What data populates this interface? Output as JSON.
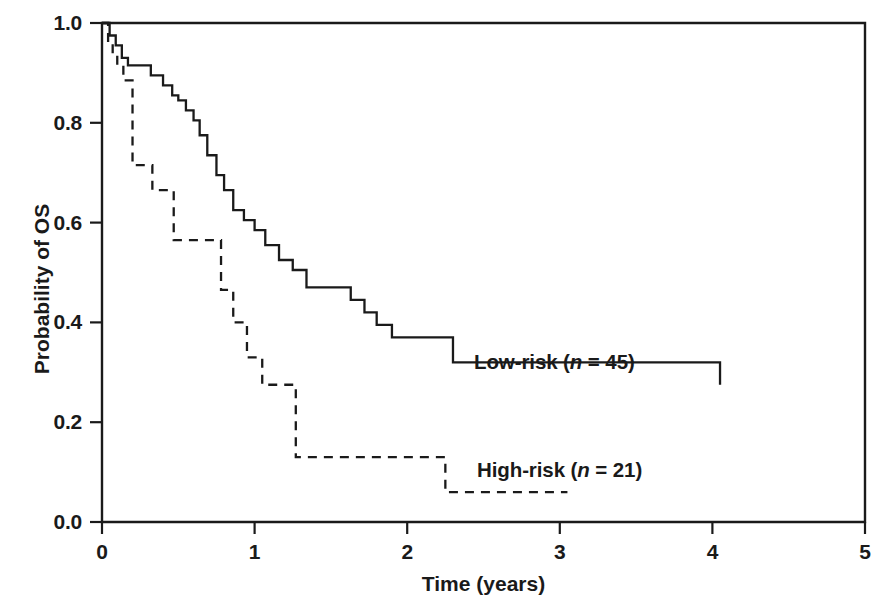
{
  "chart_data": {
    "type": "line",
    "subtype": "kaplan-meier-step",
    "title": "",
    "xlabel": "Time (years)",
    "ylabel": "Probability of OS",
    "xlim": [
      0,
      5
    ],
    "ylim": [
      0.0,
      1.0
    ],
    "xticks": [
      0,
      1,
      2,
      3,
      4,
      5
    ],
    "xtick_labels": [
      "0",
      "1",
      "2",
      "3",
      "4",
      "5"
    ],
    "yticks": [
      0.0,
      0.2,
      0.4,
      0.6,
      0.8,
      1.0
    ],
    "ytick_labels": [
      "0.0",
      "0.2",
      "0.4",
      "0.6",
      "0.8",
      "1.0"
    ],
    "grid": false,
    "legend_position": "inline-annotation",
    "series": [
      {
        "name": "Low-risk",
        "label_text": "Low-risk (n = 45)",
        "label_prefix": "Low-risk (",
        "label_italic": "n",
        "label_suffix": " = 45)",
        "n": 45,
        "linestyle": "solid",
        "color": "#1a1a1a",
        "x": [
          0.0,
          0.05,
          0.09,
          0.13,
          0.17,
          0.24,
          0.32,
          0.4,
          0.46,
          0.5,
          0.55,
          0.6,
          0.64,
          0.69,
          0.75,
          0.8,
          0.86,
          0.93,
          1.0,
          1.07,
          1.16,
          1.25,
          1.34,
          1.55,
          1.63,
          1.72,
          1.8,
          1.9,
          2.3,
          4.05
        ],
        "y": [
          1.0,
          0.975,
          0.955,
          0.93,
          0.915,
          0.915,
          0.895,
          0.875,
          0.855,
          0.845,
          0.825,
          0.805,
          0.775,
          0.735,
          0.695,
          0.665,
          0.625,
          0.605,
          0.585,
          0.555,
          0.525,
          0.505,
          0.47,
          0.47,
          0.445,
          0.42,
          0.395,
          0.37,
          0.32,
          0.275
        ]
      },
      {
        "name": "High-risk",
        "label_text": "High-risk (n = 21)",
        "label_prefix": "High-risk (",
        "label_italic": "n",
        "label_suffix": " = 21)",
        "n": 21,
        "linestyle": "dashed",
        "color": "#1a1a1a",
        "x": [
          0.0,
          0.04,
          0.07,
          0.1,
          0.14,
          0.2,
          0.33,
          0.47,
          0.62,
          0.78,
          0.86,
          0.95,
          1.05,
          1.2,
          1.27,
          2.25,
          3.05
        ],
        "y": [
          1.0,
          0.955,
          0.935,
          0.915,
          0.885,
          0.715,
          0.665,
          0.565,
          0.565,
          0.465,
          0.4,
          0.33,
          0.275,
          0.275,
          0.13,
          0.06,
          0.06
        ]
      }
    ]
  },
  "axes": {
    "x_title": "Time (years)",
    "y_title": "Probability of OS"
  },
  "style": {
    "line_color": "#1a1a1a",
    "axis_color": "#1a1a1a",
    "background": "#ffffff"
  }
}
